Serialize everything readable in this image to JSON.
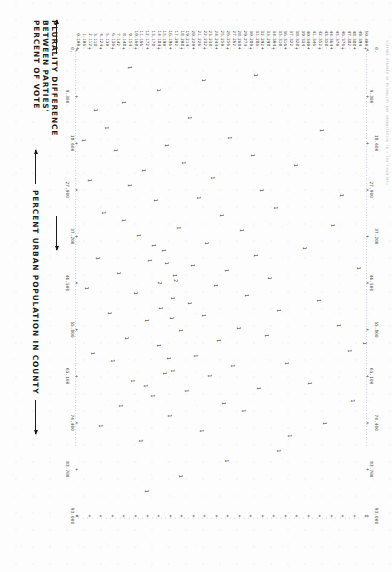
{
  "report": {
    "header_line": "SCATTER DIAGRAM  OF  PLURALITY  AND  URBANIZATION  (N = 100 COUNTIES)"
  },
  "axes": {
    "y_title_lines": [
      "PLURALITY DIFFERENCE",
      "BETWEEN PARTIES'",
      "PERCENT OF VOTE"
    ],
    "x_title": "PERCENT URBAN POPULATION IN COUNTY",
    "y_labels": [
      "50.400",
      "49.394",
      "48.388",
      "47.382",
      "46.376",
      "45.370",
      "44.364",
      "43.358",
      "42.352",
      "41.346",
      "40.340",
      "39.334",
      "38.328",
      "37.322",
      "36.316",
      "35.310",
      "34.304",
      "33.298",
      "32.292",
      "31.286",
      "30.280",
      "29.274",
      "28.268",
      "27.262",
      "26.256",
      "25.250",
      "24.244",
      "23.238",
      "22.232",
      "21.226",
      "20.220",
      "19.214",
      "18.208",
      "17.202",
      "16.196",
      "15.190",
      "14.184",
      "13.178",
      "12.172",
      "11.166",
      "10.160",
      "9.154",
      "8.148",
      "7.142",
      "6.136",
      "5.130",
      "4.124",
      "3.118",
      "2.112",
      "1.106",
      "0.100"
    ],
    "x_labels": [
      "0.",
      "9.300",
      "18.600",
      "27.900",
      "37.200",
      "46.500",
      "55.800",
      "65.100",
      "74.400",
      "83.700",
      "93.000"
    ],
    "x_min": 0.0,
    "x_max": 93.0,
    "y_min": 0.1,
    "y_max": 50.4,
    "marker_symbol": "1",
    "marker_symbol_double": "2",
    "frame_symbol": ".",
    "tick_symbol": "+"
  },
  "chart_data": {
    "type": "scatter",
    "title": "SCATTER DIAGRAM OF PLURALITY AND URBANIZATION",
    "xlabel": "PERCENT URBAN POPULATION IN COUNTY",
    "ylabel": "PLURALITY DIFFERENCE BETWEEN PARTIES' PERCENT OF VOTE",
    "xlim": [
      0.0,
      93.0
    ],
    "ylim": [
      0.1,
      50.4
    ],
    "xticks": [
      0.0,
      9.3,
      18.6,
      27.9,
      37.2,
      46.5,
      55.8,
      65.1,
      74.4,
      83.7,
      93.0
    ],
    "grid": false,
    "legend": null,
    "point_label": "1 = one county; 2 = two counties at same cell",
    "points": [
      {
        "x": 60.0,
        "y": 47.5,
        "n": 1
      },
      {
        "x": 74.5,
        "y": 43.0,
        "n": 1
      },
      {
        "x": 39.5,
        "y": 39.5,
        "n": 1
      },
      {
        "x": 62.5,
        "y": 36.5,
        "n": 1
      },
      {
        "x": 52.0,
        "y": 35.0,
        "n": 1
      },
      {
        "x": 31.5,
        "y": 34.5,
        "n": 1
      },
      {
        "x": 45.5,
        "y": 33.5,
        "n": 1
      },
      {
        "x": 57.0,
        "y": 33.0,
        "n": 1
      },
      {
        "x": 28.0,
        "y": 32.0,
        "n": 1
      },
      {
        "x": 67.5,
        "y": 31.5,
        "n": 1
      },
      {
        "x": 41.0,
        "y": 31.0,
        "n": 1
      },
      {
        "x": 21.0,
        "y": 30.5,
        "n": 1
      },
      {
        "x": 49.0,
        "y": 29.5,
        "n": 1
      },
      {
        "x": 72.0,
        "y": 29.0,
        "n": 1
      },
      {
        "x": 36.0,
        "y": 28.5,
        "n": 1
      },
      {
        "x": 55.5,
        "y": 28.0,
        "n": 1
      },
      {
        "x": 63.0,
        "y": 27.0,
        "n": 1
      },
      {
        "x": 17.5,
        "y": 26.5,
        "n": 1
      },
      {
        "x": 44.0,
        "y": 26.0,
        "n": 1
      },
      {
        "x": 70.5,
        "y": 25.5,
        "n": 1
      },
      {
        "x": 33.0,
        "y": 25.0,
        "n": 1
      },
      {
        "x": 58.0,
        "y": 24.5,
        "n": 1
      },
      {
        "x": 47.0,
        "y": 24.0,
        "n": 1
      },
      {
        "x": 25.5,
        "y": 23.5,
        "n": 1
      },
      {
        "x": 65.0,
        "y": 23.0,
        "n": 1
      },
      {
        "x": 38.5,
        "y": 22.5,
        "n": 1
      },
      {
        "x": 53.0,
        "y": 22.0,
        "n": 1
      },
      {
        "x": 76.0,
        "y": 21.5,
        "n": 1
      },
      {
        "x": 29.5,
        "y": 21.0,
        "n": 1
      },
      {
        "x": 61.0,
        "y": 20.5,
        "n": 1
      },
      {
        "x": 43.0,
        "y": 20.0,
        "n": 1
      },
      {
        "x": 50.5,
        "y": 19.5,
        "n": 1
      },
      {
        "x": 68.0,
        "y": 19.0,
        "n": 1
      },
      {
        "x": 22.5,
        "y": 18.5,
        "n": 1
      },
      {
        "x": 56.0,
        "y": 18.0,
        "n": 1
      },
      {
        "x": 35.5,
        "y": 17.5,
        "n": 1
      },
      {
        "x": 46.0,
        "y": 17.0,
        "n": 2
      },
      {
        "x": 64.0,
        "y": 16.5,
        "n": 1
      },
      {
        "x": 73.0,
        "y": 16.0,
        "n": 1
      },
      {
        "x": 19.0,
        "y": 15.5,
        "n": 1
      },
      {
        "x": 40.0,
        "y": 15.0,
        "n": 1
      },
      {
        "x": 51.5,
        "y": 14.5,
        "n": 1
      },
      {
        "x": 59.0,
        "y": 14.0,
        "n": 1
      },
      {
        "x": 30.0,
        "y": 13.5,
        "n": 1
      },
      {
        "x": 69.0,
        "y": 13.0,
        "n": 1
      },
      {
        "x": 42.0,
        "y": 12.5,
        "n": 1
      },
      {
        "x": 54.0,
        "y": 12.0,
        "n": 1
      },
      {
        "x": 24.0,
        "y": 11.5,
        "n": 1
      },
      {
        "x": 78.0,
        "y": 11.0,
        "n": 1
      },
      {
        "x": 37.0,
        "y": 10.5,
        "n": 1
      },
      {
        "x": 48.5,
        "y": 10.0,
        "n": 1
      },
      {
        "x": 66.0,
        "y": 9.5,
        "n": 1
      },
      {
        "x": 27.0,
        "y": 9.0,
        "n": 1
      },
      {
        "x": 57.5,
        "y": 8.5,
        "n": 1
      },
      {
        "x": 34.0,
        "y": 8.0,
        "n": 1
      },
      {
        "x": 71.0,
        "y": 7.5,
        "n": 1
      },
      {
        "x": 44.5,
        "y": 7.0,
        "n": 1
      },
      {
        "x": 20.0,
        "y": 6.5,
        "n": 1
      },
      {
        "x": 62.0,
        "y": 6.0,
        "n": 1
      },
      {
        "x": 52.5,
        "y": 5.5,
        "n": 1
      },
      {
        "x": 15.5,
        "y": 5.0,
        "n": 1
      },
      {
        "x": 32.5,
        "y": 4.5,
        "n": 1
      },
      {
        "x": 75.0,
        "y": 4.0,
        "n": 1
      },
      {
        "x": 41.5,
        "y": 3.5,
        "n": 1
      },
      {
        "x": 12.0,
        "y": 3.0,
        "n": 1
      },
      {
        "x": 60.5,
        "y": 2.5,
        "n": 1
      },
      {
        "x": 26.0,
        "y": 2.0,
        "n": 1
      },
      {
        "x": 47.5,
        "y": 1.5,
        "n": 1
      },
      {
        "x": 18.0,
        "y": 1.0,
        "n": 1
      },
      {
        "x": 82.0,
        "y": 26.0,
        "n": 1
      },
      {
        "x": 85.0,
        "y": 18.0,
        "n": 1
      },
      {
        "x": 80.0,
        "y": 35.0,
        "n": 1
      },
      {
        "x": 88.0,
        "y": 12.0,
        "n": 1
      },
      {
        "x": 8.0,
        "y": 14.0,
        "n": 1
      },
      {
        "x": 6.0,
        "y": 22.0,
        "n": 1
      },
      {
        "x": 10.5,
        "y": 8.0,
        "n": 1
      },
      {
        "x": 5.0,
        "y": 31.0,
        "n": 1
      },
      {
        "x": 13.5,
        "y": 19.5,
        "n": 1
      },
      {
        "x": 3.5,
        "y": 9.0,
        "n": 1
      },
      {
        "x": 66.5,
        "y": 40.5,
        "n": 1
      },
      {
        "x": 50.0,
        "y": 42.0,
        "n": 1
      },
      {
        "x": 35.0,
        "y": 44.5,
        "n": 1
      },
      {
        "x": 55.0,
        "y": 45.5,
        "n": 1
      },
      {
        "x": 23.0,
        "y": 38.0,
        "n": 1
      },
      {
        "x": 77.0,
        "y": 37.0,
        "n": 1
      },
      {
        "x": 43.5,
        "y": 49.0,
        "n": 1
      },
      {
        "x": 16.0,
        "y": 42.5,
        "n": 1
      },
      {
        "x": 70.0,
        "y": 48.0,
        "n": 1
      },
      {
        "x": 29.0,
        "y": 46.0,
        "n": 1
      },
      {
        "x": 58.5,
        "y": 50.0,
        "n": 1
      },
      {
        "x": 46.5,
        "y": 14.2,
        "n": 2
      },
      {
        "x": 45.0,
        "y": 16.8,
        "n": 1
      },
      {
        "x": 49.5,
        "y": 16.6,
        "n": 1
      },
      {
        "x": 53.5,
        "y": 16.4,
        "n": 1
      },
      {
        "x": 42.5,
        "y": 15.4,
        "n": 1
      },
      {
        "x": 39.0,
        "y": 13.2,
        "n": 1
      },
      {
        "x": 61.5,
        "y": 15.8,
        "n": 1
      },
      {
        "x": 64.5,
        "y": 15.2,
        "n": 1
      },
      {
        "x": 67.0,
        "y": 11.8,
        "n": 1
      }
    ]
  }
}
